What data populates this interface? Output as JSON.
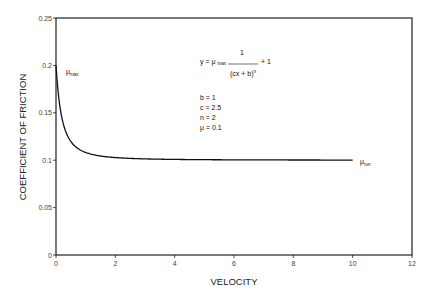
{
  "chart_data": {
    "type": "line",
    "title": "",
    "xlabel": "VELOCITY",
    "ylabel": "COEFFICIENT OF FRICTION",
    "xlim": [
      0,
      12
    ],
    "ylim": [
      0,
      0.25
    ],
    "x_ticks": [
      "0",
      "2",
      "4",
      "6",
      "8",
      "10",
      "12"
    ],
    "x_tick_values": [
      0,
      2,
      4,
      6,
      8,
      10,
      12
    ],
    "y_ticks": [
      "0",
      "0.05",
      "0.1",
      "0.15",
      "0.2",
      "0.25"
    ],
    "y_tick_values": [
      0,
      0.05,
      0.1,
      0.15,
      0.2,
      0.25
    ],
    "grid": false,
    "legend": "none",
    "series": [
      {
        "name": "friction curve",
        "formula": "y = mu * (1/(c*x + b)^n + 1)",
        "params": {
          "b": 1,
          "c": 2.5,
          "n": 2,
          "mu": 0.1
        },
        "x_range": [
          0,
          10
        ],
        "x": [
          0,
          0.1,
          0.2,
          0.3,
          0.4,
          0.5,
          0.6,
          0.8,
          1.0,
          1.5,
          2,
          3,
          4,
          5,
          6,
          7,
          8,
          9,
          10
        ],
        "values": [
          0.2,
          0.164,
          0.1444,
          0.1327,
          0.125,
          0.1196,
          0.1156,
          0.1111,
          0.1082,
          0.1043,
          0.1028,
          0.1014,
          0.1008,
          0.1005,
          0.1004,
          0.1003,
          0.1002,
          0.1002,
          0.1001
        ]
      }
    ],
    "annotations": {
      "mu_max_label": "μ",
      "mu_max_sub": "max",
      "mu_run_label": "μ",
      "mu_run_sub": "run",
      "formula_prefix": "y = μ",
      "formula_sub": "max",
      "formula_numerator": "1",
      "formula_plus": "+ 1",
      "formula_denominator": "(cx + b)",
      "formula_exponent": "n",
      "params": [
        "b = 1",
        "c = 2.5",
        "n = 2",
        "μ = 0.1"
      ]
    }
  }
}
